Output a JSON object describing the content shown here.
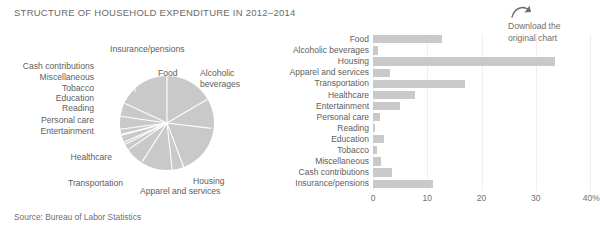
{
  "header": {
    "title": "STRUCTURE OF HOUSEHOLD EXPENDITURE IN 2012–2014"
  },
  "download": {
    "icon": "curved-arrow-icon",
    "line1": "Download the",
    "line2": "original chart"
  },
  "footer": {
    "source": "Source: Bureau of Labor Statistics"
  },
  "colors": {
    "bar": "#c9c9c9",
    "pie": "#c9c9c9",
    "pie_separator": "#ffffff",
    "grid": "#eeeeee",
    "text": "#5e5e5e"
  },
  "pie_labels": [
    {
      "text": "Insurance/pensions",
      "side": "top"
    },
    {
      "text": "Cash contributions",
      "side": "left"
    },
    {
      "text": "Miscellaneous",
      "side": "left"
    },
    {
      "text": "Tobacco",
      "side": "left"
    },
    {
      "text": "Education",
      "side": "left"
    },
    {
      "text": "Reading",
      "side": "left"
    },
    {
      "text": "Personal care",
      "side": "left"
    },
    {
      "text": "Entertainment",
      "side": "left"
    },
    {
      "text": "Healthcare",
      "side": "left"
    },
    {
      "text": "Transportation",
      "side": "bottom"
    },
    {
      "text": "Apparel and services",
      "side": "bottom"
    },
    {
      "text": "Housing",
      "side": "bottom"
    },
    {
      "text": "Food",
      "side": "top"
    },
    {
      "text": "Alcoholic\nbeverages",
      "side": "top"
    }
  ],
  "pie_label_food": "Food",
  "pie_label_alcoholic_l1": "Alcoholic",
  "pie_label_alcoholic_l2": "beverages",
  "pie_label_insurance": "Insurance/pensions",
  "pie_label_cash": "Cash contributions",
  "pie_label_misc": "Miscellaneous",
  "pie_label_tobacco": "Tobacco",
  "pie_label_education": "Education",
  "pie_label_reading": "Reading",
  "pie_label_personal": "Personal care",
  "pie_label_entertainment": "Entertainment",
  "pie_label_healthcare": "Healthcare",
  "pie_label_transportation": "Transportation",
  "pie_label_apparel": "Apparel and services",
  "pie_label_housing": "Housing",
  "chart_data": [
    {
      "type": "pie",
      "title": "STRUCTURE OF HOUSEHOLD EXPENDITURE IN 2012–2014",
      "labels": [
        "Food",
        "Alcoholic beverages",
        "Housing",
        "Apparel and services",
        "Transportation",
        "Healthcare",
        "Entertainment",
        "Personal care",
        "Reading",
        "Education",
        "Tobacco",
        "Miscellaneous",
        "Cash contributions",
        "Insurance/pensions"
      ],
      "values": [
        12.8,
        0.9,
        33.5,
        3.2,
        17.0,
        7.8,
        5.0,
        1.2,
        0.3,
        2.0,
        0.7,
        1.5,
        3.5,
        11.0
      ],
      "legend": "none",
      "slice_color": "#c9c9c9",
      "separator_color": "#ffffff"
    },
    {
      "type": "bar",
      "orientation": "horizontal",
      "categories": [
        "Food",
        "Alcoholic beverages",
        "Housing",
        "Apparel and services",
        "Transportation",
        "Healthcare",
        "Entertainment",
        "Personal care",
        "Reading",
        "Education",
        "Tobacco",
        "Miscellaneous",
        "Cash contributions",
        "Insurance/pensions"
      ],
      "values": [
        12.8,
        0.9,
        33.5,
        3.2,
        17.0,
        7.8,
        5.0,
        1.2,
        0.3,
        2.0,
        0.7,
        1.5,
        3.5,
        11.0
      ],
      "xlabel": "",
      "ylabel": "",
      "xlim": [
        0,
        40
      ],
      "xticks": [
        0,
        10,
        20,
        30,
        40
      ],
      "xticklabels": [
        "0",
        "10",
        "20",
        "30",
        "40%"
      ],
      "grid": "vertical",
      "legend": "none",
      "bar_color": "#c9c9c9"
    }
  ]
}
